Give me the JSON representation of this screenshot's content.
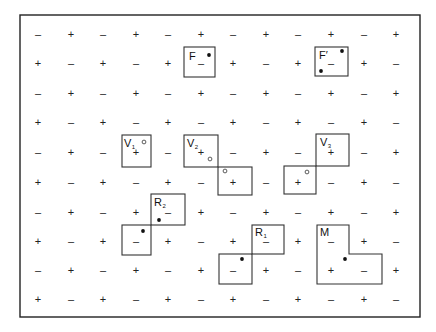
{
  "diagram": {
    "frame": {
      "x": 20,
      "y": 15,
      "w": 400,
      "h": 302
    },
    "grid": {
      "cols": 12,
      "rows": 10,
      "col_x": [
        38,
        71,
        103,
        136,
        168,
        201,
        233,
        266,
        298,
        331,
        364,
        396
      ],
      "row_y": [
        34,
        63,
        93,
        122,
        152,
        182,
        212,
        241,
        270,
        299
      ],
      "pattern": "checkerboard",
      "even_sign": "–",
      "odd_sign": "+",
      "minus_glyph": "–",
      "plus_glyph": "+"
    },
    "figures": [
      {
        "name": "F",
        "label": "F",
        "subscript": "",
        "label_pos": [
          189,
          60
        ],
        "cells": [
          [
            184,
            47,
            31,
            30
          ]
        ],
        "filled_dots": [
          [
            209,
            55
          ]
        ],
        "open_dots": []
      },
      {
        "name": "F-prime",
        "label": "F′",
        "subscript": "",
        "label_pos": [
          319,
          59
        ],
        "cells": [
          [
            315,
            47,
            33,
            29
          ]
        ],
        "filled_dots": [
          [
            342,
            51
          ],
          [
            321,
            71
          ]
        ],
        "open_dots": []
      },
      {
        "name": "V1",
        "label": "V",
        "subscript": "1",
        "label_pos": [
          124,
          147
        ],
        "cells": [
          [
            122,
            135,
            29,
            32
          ]
        ],
        "filled_dots": [],
        "open_dots": [
          [
            144,
            142
          ]
        ]
      },
      {
        "name": "V2",
        "label": "V",
        "subscript": "2",
        "label_pos": [
          187,
          147
        ],
        "cells": [
          [
            184,
            135,
            34,
            32
          ],
          [
            218,
            167,
            34,
            28
          ]
        ],
        "filled_dots": [],
        "open_dots": [
          [
            210,
            159
          ],
          [
            225,
            171
          ]
        ]
      },
      {
        "name": "V3",
        "label": "V",
        "subscript": "3",
        "label_pos": [
          320,
          146
        ],
        "cells": [
          [
            316,
            134,
            33,
            32
          ],
          [
            284,
            166,
            32,
            28
          ]
        ],
        "filled_dots": [],
        "open_dots": [
          [
            307,
            172
          ]
        ]
      },
      {
        "name": "R2",
        "label": "R",
        "subscript": "2",
        "label_pos": [
          154,
          206
        ],
        "cells": [
          [
            151,
            194,
            34,
            31
          ],
          [
            122,
            225,
            29,
            30
          ]
        ],
        "filled_dots": [
          [
            159,
            220
          ],
          [
            143,
            231
          ]
        ],
        "open_dots": []
      },
      {
        "name": "R1",
        "label": "R",
        "subscript": "1",
        "label_pos": [
          255,
          236
        ],
        "cells": [
          [
            252,
            225,
            32,
            29
          ],
          [
            219,
            254,
            33,
            30
          ]
        ],
        "filled_dots": [
          [
            242,
            259
          ]
        ],
        "open_dots": []
      },
      {
        "name": "M",
        "label": "M",
        "subscript": "",
        "label_pos": [
          320,
          236
        ],
        "outline": [
          [
            317,
            225
          ],
          [
            349,
            225
          ],
          [
            349,
            254
          ],
          [
            382,
            254
          ],
          [
            382,
            284
          ],
          [
            317,
            284
          ]
        ],
        "cells": [],
        "filled_dots": [
          [
            345,
            259
          ]
        ],
        "open_dots": []
      }
    ]
  }
}
